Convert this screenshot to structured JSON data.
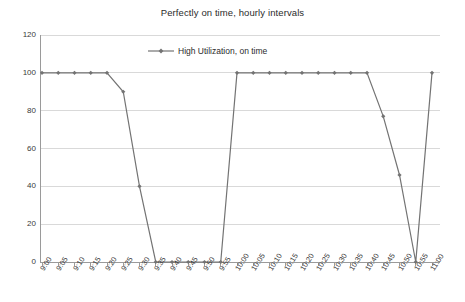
{
  "chart_data": {
    "type": "line",
    "title": "Perfectly on time, hourly intervals",
    "xlabel": "",
    "ylabel": "",
    "ylim": [
      0,
      120
    ],
    "yticks": [
      0,
      20,
      40,
      60,
      80,
      100,
      120
    ],
    "grid": true,
    "legend_position": "top-center",
    "categories": [
      "9:00",
      "9:05",
      "9:10",
      "9:15",
      "9:20",
      "9:25",
      "9:30",
      "9:35",
      "9:40",
      "9:45",
      "9:50",
      "9:55",
      "10:00",
      "10:05",
      "10:10",
      "10:15",
      "10:20",
      "10:25",
      "10:30",
      "10:35",
      "10:40",
      "10:45",
      "10:50",
      "10:55",
      "11:00"
    ],
    "series": [
      {
        "name": "High Utilization, on time",
        "color": "#737373",
        "marker": "diamond",
        "values": [
          100,
          100,
          100,
          100,
          100,
          90,
          40,
          0,
          0,
          0,
          0,
          0,
          100,
          100,
          100,
          100,
          100,
          100,
          100,
          100,
          100,
          77,
          46,
          0,
          100
        ]
      }
    ]
  },
  "legend": {
    "entries": [
      {
        "label": "High Utilization, on time"
      }
    ]
  },
  "axis": {
    "y_tick_labels": [
      "120",
      "100",
      "80",
      "60",
      "40",
      "20",
      "0"
    ],
    "x_tick_labels": [
      "9:00",
      "9:05",
      "9:10",
      "9:15",
      "9:20",
      "9:25",
      "9:30",
      "9:35",
      "9:40",
      "9:45",
      "9:50",
      "9:55",
      "10:00",
      "10:05",
      "10:10",
      "10:15",
      "10:20",
      "10:25",
      "10:30",
      "10:35",
      "10:40",
      "10:45",
      "10:50",
      "10:55",
      "11:00"
    ]
  },
  "colors": {
    "series_line": "#737373",
    "grid": "#d9d9d9",
    "axis": "#9a9a9a",
    "text": "#2b2b2b",
    "background": "#ffffff"
  }
}
